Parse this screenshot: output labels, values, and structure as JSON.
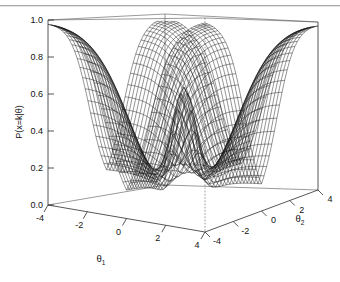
{
  "figure": {
    "kind": "perspective-wireframe-surface",
    "background": "#ffffff",
    "ink_color": "#111111",
    "mesh_color": "#1a1a1a",
    "frame_color": "#2b2b2b"
  },
  "axes": {
    "z": {
      "label": "P(x=k|θ)",
      "ticks": [
        "1.0",
        "0.8",
        "0.6",
        "0.4",
        "0.2",
        "0.0"
      ],
      "tick_values": [
        1.0,
        0.8,
        0.6,
        0.4,
        0.2,
        0.0
      ],
      "range": [
        0.0,
        1.0
      ]
    },
    "x": {
      "label": "θ",
      "label_sub": "1",
      "ticks": [
        "-4",
        "-2",
        "0",
        "2",
        "4"
      ],
      "tick_values": [
        -4,
        -2,
        0,
        2,
        4
      ],
      "range": [
        -4,
        4
      ]
    },
    "y": {
      "label": "θ",
      "label_sub": "2",
      "ticks": [
        "-4",
        "-2",
        "0",
        "2",
        "4"
      ],
      "tick_values": [
        -4,
        -2,
        0,
        2,
        4
      ],
      "range": [
        -4,
        4
      ]
    }
  },
  "chart_data": {
    "type": "surface",
    "title": "",
    "xlabel": "θ₁",
    "ylabel": "θ₂",
    "zlabel": "P(x=k|θ)",
    "xlim": [
      -4,
      4
    ],
    "ylim": [
      -4,
      4
    ],
    "zlim": [
      0.0,
      1.0
    ],
    "grid": false,
    "legend": "none",
    "x": [
      -4,
      -3,
      -2,
      -1,
      0,
      1,
      2,
      3,
      4
    ],
    "y": [
      -4,
      -3,
      -2,
      -1,
      0,
      1,
      2,
      3,
      4
    ],
    "z": [
      [
        1.0,
        1.0,
        0.99,
        0.96,
        0.87,
        0.96,
        0.99,
        1.0,
        1.0
      ],
      [
        1.0,
        0.99,
        0.97,
        0.88,
        0.64,
        0.88,
        0.97,
        0.99,
        1.0
      ],
      [
        0.99,
        0.97,
        0.9,
        0.66,
        0.33,
        0.66,
        0.9,
        0.97,
        0.99
      ],
      [
        0.96,
        0.88,
        0.66,
        0.33,
        0.14,
        0.33,
        0.66,
        0.88,
        0.96
      ],
      [
        0.87,
        0.64,
        0.33,
        0.14,
        0.6,
        0.14,
        0.33,
        0.64,
        0.87
      ],
      [
        0.96,
        0.88,
        0.66,
        0.33,
        0.14,
        0.33,
        0.66,
        0.88,
        0.96
      ],
      [
        0.99,
        0.97,
        0.9,
        0.66,
        0.33,
        0.66,
        0.9,
        0.97,
        0.99
      ],
      [
        1.0,
        0.99,
        0.97,
        0.88,
        0.64,
        0.88,
        0.97,
        0.99,
        1.0
      ],
      [
        1.0,
        1.0,
        0.99,
        0.96,
        0.87,
        0.96,
        0.99,
        1.0,
        1.0
      ]
    ],
    "annotations": []
  }
}
